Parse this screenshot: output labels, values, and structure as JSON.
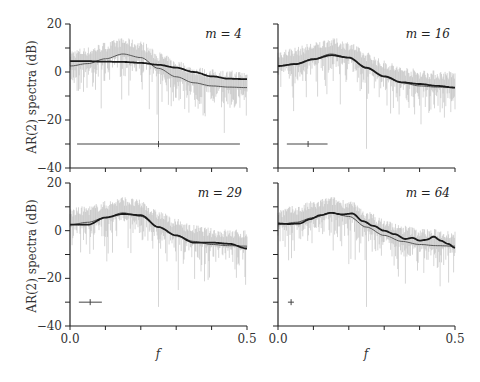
{
  "chart_data": {
    "type": "line",
    "ylabel": "AR(2) spectra  (dB)",
    "xlabel": "f",
    "xlim": [
      0.0,
      0.5
    ],
    "ylim": [
      -40,
      20
    ],
    "xticks": [
      0.0,
      0.1,
      0.2,
      0.3,
      0.4,
      0.5
    ],
    "xtick_labels": [
      "0.0",
      "0.5"
    ],
    "yticks": [
      -40,
      -30,
      -20,
      -10,
      0,
      10,
      20
    ],
    "ytick_labels": [
      "20",
      "0",
      "−20",
      "−40"
    ],
    "grid": false,
    "colors": {
      "raw": "#b8b8b8",
      "true": "#555555",
      "estimate": "#1a1a1a",
      "axis": "#222222"
    },
    "panels": [
      {
        "label": "m = 4",
        "m": 4,
        "true_curve": {
          "f": [
            0.0,
            0.05,
            0.1,
            0.15,
            0.2,
            0.25,
            0.3,
            0.35,
            0.4,
            0.45,
            0.5
          ],
          "db": [
            2.5,
            3.5,
            5.5,
            7.5,
            6,
            1.5,
            -2,
            -4.5,
            -5.8,
            -6.3,
            -6.5
          ]
        },
        "estimate_curve": {
          "f": [
            0.0,
            0.05,
            0.1,
            0.15,
            0.2,
            0.25,
            0.3,
            0.35,
            0.4,
            0.45,
            0.5
          ],
          "db": [
            4.5,
            4.5,
            4.3,
            4.2,
            3.8,
            3,
            1.8,
            0,
            -1.8,
            -2.8,
            -3
          ]
        },
        "interval": {
          "f_low": 0.02,
          "f_high": 0.48,
          "f_center": 0.25,
          "y": -30
        }
      },
      {
        "label": "m = 16",
        "m": 16,
        "true_curve": {
          "f": [
            0.0,
            0.05,
            0.1,
            0.15,
            0.2,
            0.25,
            0.3,
            0.35,
            0.4,
            0.45,
            0.5
          ],
          "db": [
            2.5,
            3.5,
            5.5,
            7.5,
            6,
            1.5,
            -2,
            -4.5,
            -5.8,
            -6.3,
            -6.5
          ]
        },
        "estimate_curve": {
          "f": [
            0.0,
            0.05,
            0.1,
            0.15,
            0.2,
            0.25,
            0.3,
            0.35,
            0.4,
            0.45,
            0.5
          ],
          "db": [
            2.5,
            3.3,
            5.3,
            7,
            6,
            1.8,
            -1.8,
            -4.3,
            -5,
            -5.8,
            -6.5
          ]
        },
        "interval": {
          "f_low": 0.025,
          "f_high": 0.14,
          "f_center": 0.085,
          "y": -30
        }
      },
      {
        "label": "m = 29",
        "m": 29,
        "true_curve": {
          "f": [
            0.0,
            0.05,
            0.1,
            0.15,
            0.2,
            0.25,
            0.3,
            0.35,
            0.4,
            0.45,
            0.5
          ],
          "db": [
            2.5,
            3.5,
            5.5,
            7.5,
            6,
            1.5,
            -2,
            -4.5,
            -5.8,
            -6.3,
            -6.5
          ]
        },
        "estimate_curve": {
          "f": [
            0.0,
            0.05,
            0.1,
            0.15,
            0.2,
            0.25,
            0.3,
            0.35,
            0.4,
            0.45,
            0.5
          ],
          "db": [
            2.5,
            2.5,
            5.5,
            7,
            6.5,
            1.5,
            -2,
            -5,
            -5,
            -5.5,
            -7.5
          ]
        },
        "interval": {
          "f_low": 0.025,
          "f_high": 0.09,
          "f_center": 0.057,
          "y": -30
        }
      },
      {
        "label": "m = 64",
        "m": 64,
        "true_curve": {
          "f": [
            0.0,
            0.05,
            0.1,
            0.15,
            0.2,
            0.25,
            0.3,
            0.35,
            0.4,
            0.45,
            0.5
          ],
          "db": [
            2.5,
            3.5,
            5.5,
            7.5,
            6,
            1.5,
            -2,
            -4.5,
            -5.8,
            -6.3,
            -6.5
          ]
        },
        "estimate_curve": {
          "f": [
            0.0,
            0.03,
            0.06,
            0.09,
            0.12,
            0.15,
            0.18,
            0.21,
            0.24,
            0.27,
            0.3,
            0.33,
            0.36,
            0.38,
            0.4,
            0.42,
            0.44,
            0.46,
            0.48,
            0.5
          ],
          "db": [
            3,
            2.8,
            3,
            4.8,
            6.5,
            7.5,
            6.8,
            7.2,
            4,
            2,
            0,
            -1.5,
            -3.5,
            -3,
            -4.2,
            -3.8,
            -2.5,
            -4.2,
            -5.5,
            -7.2
          ]
        },
        "interval": {
          "f_low": 0.028,
          "f_high": 0.045,
          "f_center": 0.037,
          "y": -30
        }
      }
    ]
  }
}
